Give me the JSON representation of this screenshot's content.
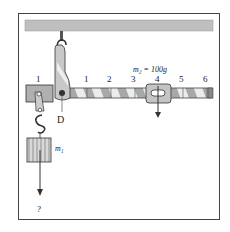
{
  "diagram": {
    "scale_labels": [
      "1",
      "1",
      "2",
      "3",
      "4",
      "5",
      "6"
    ],
    "pivot_label": "D",
    "slider_mass_label": "m₂ = 100g",
    "hanging_mass_label": "m₁",
    "unknown_label": "?",
    "colors": {
      "ceiling": "#bfbfbf",
      "beam_light": "#e8e8e8",
      "beam_dark": "#9a9a9a",
      "outline": "#333333"
    }
  }
}
